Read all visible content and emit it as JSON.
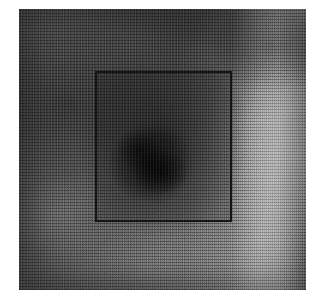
{
  "figure": {
    "kind": "grayscale-scan-image",
    "caption": "",
    "plate": {
      "left_px": 19,
      "top_px": 9,
      "width_px": 287,
      "height_px": 281,
      "background_color": "#ffffff",
      "base_color": "#4a4a4a"
    },
    "roi_box": {
      "label": "",
      "left_px": 95,
      "top_px": 71,
      "right_px": 232,
      "bottom_px": 222,
      "width_px": 137,
      "height_px": 151,
      "stroke_color": "#151515",
      "stroke_width_px": 2
    },
    "regions": [
      {
        "name": "dark-lesion-core",
        "center_pct": [
          46,
          55
        ],
        "tone": "very-dark",
        "color": "#0d0d0d"
      },
      {
        "name": "dark-upper-band",
        "center_pct": [
          60,
          8
        ],
        "tone": "dark",
        "color": "#2a2a2a"
      },
      {
        "name": "dark-upper-right",
        "center_pct": [
          88,
          13
        ],
        "tone": "dark",
        "color": "#252525"
      },
      {
        "name": "dark-left-field",
        "center_pct": [
          18,
          34
        ],
        "tone": "dark",
        "color": "#333333"
      },
      {
        "name": "bright-right-band",
        "center_pct": [
          90,
          50
        ],
        "tone": "bright",
        "color": "#8c8c8c"
      },
      {
        "name": "light-lower-band",
        "center_pct": [
          46,
          92
        ],
        "tone": "mid-light",
        "color": "#6a6a6a"
      }
    ],
    "colors": {
      "page_background": "#ffffff",
      "darkest": "#0d0d0d",
      "mid_gray": "#4a4a4a",
      "lightest": "#9a9a9a",
      "roi_stroke": "#151515"
    },
    "texture": {
      "type": "halftone-scan-grain",
      "grain_opacity": 0.5,
      "scanline_opacity": 0.16
    }
  }
}
